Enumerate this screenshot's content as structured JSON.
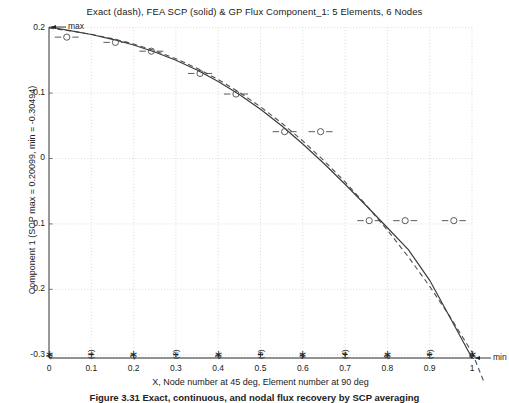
{
  "chart_data": {
    "type": "line",
    "title": "Exact (dash), FEA SCP (solid) & GP Flux Component_1:  5 Elements, 6 Nodes",
    "xlabel": "X, Node number at 45 deg, Element number at 90 deg",
    "ylabel": "Component 1 (SCP max = 0.20099, min = -0.30494)",
    "xlim": [
      0,
      1
    ],
    "ylim": [
      -0.30494,
      0.20099
    ],
    "grid": true,
    "legend": "none",
    "xticks": [
      "0",
      "0.1",
      "0.2",
      "0.3",
      "0.4",
      "0.5",
      "0.6",
      "0.7",
      "0.8",
      "0.9",
      "1"
    ],
    "xtick_values": [
      0,
      0.1,
      0.2,
      0.3,
      0.4,
      0.5,
      0.6,
      0.7,
      0.8,
      0.9,
      1
    ],
    "yticks": [
      "0.2",
      "0.1",
      "0",
      "-0.1",
      "-0.2",
      "-0.3"
    ],
    "ytick_values": [
      0.2,
      0.1,
      0,
      -0.1,
      -0.2,
      -0.3
    ],
    "series": [
      {
        "name": "FEA SCP (solid)",
        "style": "solid",
        "x": [
          0.0,
          0.05,
          0.1,
          0.15,
          0.2,
          0.25,
          0.3,
          0.35,
          0.4,
          0.45,
          0.5,
          0.55,
          0.6,
          0.65,
          0.7,
          0.75,
          0.8,
          0.85,
          0.9,
          0.95,
          1.0
        ],
        "values": [
          0.20099,
          0.1955,
          0.1895,
          0.1822,
          0.1735,
          0.1628,
          0.1502,
          0.1352,
          0.1178,
          0.0978,
          0.0752,
          0.05,
          0.0222,
          -0.0077,
          -0.0393,
          -0.0722,
          -0.1058,
          -0.1398,
          -0.1862,
          -0.2452,
          -0.30494
        ]
      },
      {
        "name": "Exact (dash)",
        "style": "dashed",
        "x": [
          0.0,
          0.05,
          0.1,
          0.15,
          0.2,
          0.25,
          0.3,
          0.35,
          0.4,
          0.45,
          0.5,
          0.55,
          0.6,
          0.65,
          0.7,
          0.75,
          0.8,
          0.85,
          0.9,
          0.95,
          1.0
        ],
        "values": [
          0.1995,
          0.195,
          0.1898,
          0.1832,
          0.175,
          0.1648,
          0.1525,
          0.1378,
          0.1208,
          0.1012,
          0.079,
          0.0542,
          0.0268,
          -0.0032,
          -0.0358,
          -0.0712,
          -0.1095,
          -0.1508,
          -0.1955,
          -0.2438,
          -0.296
        ]
      },
      {
        "name": "GP Flux",
        "style": "markers",
        "marker": "circle-with-dashes",
        "x": [
          0.042,
          0.157,
          0.242,
          0.357,
          0.442,
          0.557,
          0.642,
          0.757,
          0.842,
          0.957
        ],
        "values": [
          0.1855,
          0.177,
          0.164,
          0.13,
          0.0985,
          0.041,
          0.041,
          -0.095,
          -0.095,
          -0.095
        ]
      }
    ],
    "gp_flux_points": [
      {
        "x": 0.042,
        "y": 0.1855
      },
      {
        "x": 0.157,
        "y": 0.1775
      },
      {
        "x": 0.242,
        "y": 0.164
      },
      {
        "x": 0.357,
        "y": 0.13
      },
      {
        "x": 0.442,
        "y": 0.0985
      },
      {
        "x": 0.557,
        "y": 0.041
      },
      {
        "x": 0.642,
        "y": 0.041
      },
      {
        "x": 0.757,
        "y": -0.095
      },
      {
        "x": 0.842,
        "y": -0.095
      },
      {
        "x": 0.957,
        "y": -0.095
      }
    ],
    "annotations": [
      {
        "label": "max",
        "x": 0.0,
        "y": 0.20099
      },
      {
        "label": "min",
        "x": 1.0,
        "y": -0.30494
      }
    ],
    "nodes": [
      {
        "label": "1",
        "x": 0.0
      },
      {
        "label": "2",
        "x": 0.2
      },
      {
        "label": "3",
        "x": 0.4
      },
      {
        "label": "4",
        "x": 0.6
      },
      {
        "label": "5",
        "x": 0.8
      },
      {
        "label": "6",
        "x": 1.0
      }
    ],
    "elements": [
      {
        "label": "(1)",
        "x": 0.1
      },
      {
        "label": "(2)",
        "x": 0.3
      },
      {
        "label": "(3)",
        "x": 0.5
      },
      {
        "label": "(4)",
        "x": 0.7
      },
      {
        "label": "(5)",
        "x": 0.9
      }
    ],
    "marker_row_y": -0.3,
    "colors": {
      "axis": "#6e6e6e",
      "grid": "#c8c8c8",
      "solid_curve": "#3c3c3c",
      "dashed_curve": "#505050",
      "marker": "#4a4a4a",
      "text": "#222222",
      "background": "#ffffff"
    }
  },
  "caption": {
    "text": "Figure 3.31 Exact, continuous, and nodal flux recovery by SCP averaging"
  }
}
